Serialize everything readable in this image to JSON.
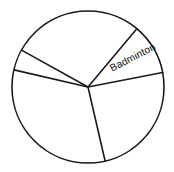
{
  "chart_data": {
    "type": "pie",
    "title": "",
    "subtitle": "",
    "xlabel": "",
    "ylabel": "",
    "legend_position": "none",
    "grid": false,
    "center": {
      "x": 88,
      "y": 87
    },
    "radius": 76,
    "labels_shown": [
      "Badminton"
    ],
    "categories": [
      "Slice 1",
      "Badminton",
      "Slice 3",
      "Slice 4",
      "Slice 5"
    ],
    "values": [
      39,
      39,
      88,
      132,
      62
    ],
    "slices": [
      {
        "name": "slice-unlabeled-right-lower",
        "label": "",
        "start_angle_deg": 349,
        "end_angle_deg": 77,
        "sweep_deg": 88,
        "fill": "#ffffff",
        "shaded": false
      },
      {
        "name": "slice-unlabeled-bottom-left",
        "label": "",
        "start_angle_deg": 77,
        "end_angle_deg": 209,
        "sweep_deg": 132,
        "fill": "#ffffff",
        "shaded": false
      },
      {
        "name": "slice-unlabeled-thin-left",
        "label": "",
        "start_angle_deg": 209,
        "end_angle_deg": 193,
        "sweep_deg": 16,
        "fill": "#ffffff",
        "shaded": false
      },
      {
        "name": "slice-unlabeled-top-large",
        "label": "",
        "start_angle_deg": 193,
        "end_angle_deg": 310,
        "sweep_deg": 117,
        "fill": "#ffffff",
        "shaded": false
      },
      {
        "name": "slice-badminton",
        "label": "Badminton",
        "start_angle_deg": 310,
        "end_angle_deg": 349,
        "sweep_deg": 39,
        "fill": "#d0d0d0",
        "shaded": true
      }
    ],
    "dividers": [
      {
        "name": "divider-badminton-upper",
        "angle_deg": 310,
        "x2": 137,
        "y2": 29
      },
      {
        "name": "divider-badminton-lower",
        "angle_deg": 349,
        "x2": 163,
        "y2": 73
      },
      {
        "name": "divider-bottom",
        "angle_deg": 77,
        "x2": 105,
        "y2": 161
      },
      {
        "name": "divider-left-lower",
        "angle_deg": 209,
        "x2": 21,
        "y2": 124
      },
      {
        "name": "divider-left-upper",
        "angle_deg": 193,
        "x2": 14,
        "y2": 104
      }
    ],
    "label_placement": {
      "badminton": {
        "text": "Badminton",
        "x": 133,
        "y": 58,
        "rotation_deg": -27,
        "color": "#111111"
      }
    },
    "colors": {
      "shaded_fill": "#d0d0d0",
      "unshaded_fill": "#ffffff",
      "stroke": "#1a1a1a",
      "background": "#ffffff",
      "label_text": "#111111"
    }
  }
}
